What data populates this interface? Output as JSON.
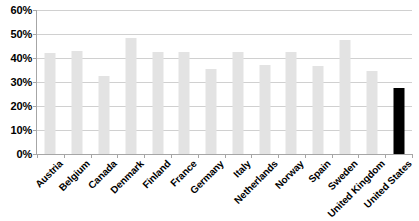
{
  "chart_data": {
    "type": "bar",
    "title": "",
    "subtitle": "",
    "xlabel": "",
    "ylabel": "",
    "ylim": [
      0,
      60
    ],
    "ytick_labels": [
      "60%",
      "50%",
      "40%",
      "30%",
      "20%",
      "10%",
      "0%"
    ],
    "ytick_values": [
      60,
      50,
      40,
      30,
      20,
      10,
      0
    ],
    "grid": true,
    "legend": "none",
    "categories": [
      "Austria",
      "Belgium",
      "Canada",
      "Denmark",
      "Finland",
      "France",
      "Germany",
      "Italy",
      "Netherlands",
      "Norway",
      "Spain",
      "Sweden",
      "United Kingdom",
      "United States"
    ],
    "values": [
      42,
      43,
      32.5,
      48.5,
      42.5,
      42.5,
      35.5,
      42.5,
      37,
      42.5,
      36.5,
      47.5,
      34.5,
      27.5
    ],
    "bar_colors": [
      "#e3e3e3",
      "#e3e3e3",
      "#e3e3e3",
      "#e3e3e3",
      "#e3e3e3",
      "#e3e3e3",
      "#e3e3e3",
      "#e3e3e3",
      "#e3e3e3",
      "#e3e3e3",
      "#e3e3e3",
      "#e3e3e3",
      "#e3e3e3",
      "#000000"
    ],
    "highlight_category": "United States",
    "colors": {
      "default_bar": "#e3e3e3",
      "highlight_bar": "#000000",
      "gridline": "#d0d0d0",
      "axis": "#a6a6a6",
      "text": "#000000",
      "background": "#ffffff"
    }
  }
}
